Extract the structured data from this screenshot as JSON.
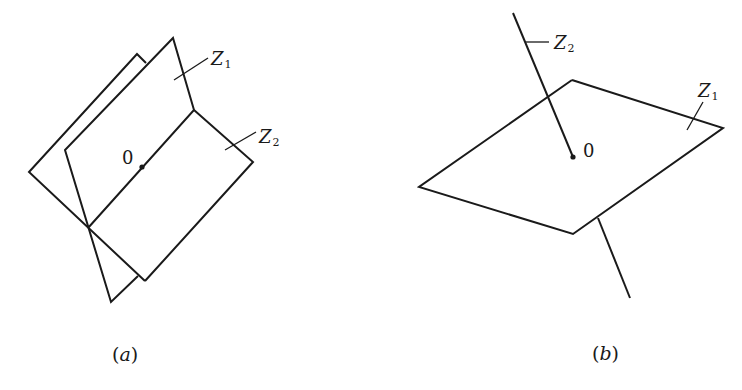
{
  "figure": {
    "stroke_color": "#1a1a1a",
    "background": "#ffffff",
    "panels": [
      {
        "id": "a",
        "caption": {
          "open": "(",
          "letter": "a",
          "close": ")",
          "x": 112,
          "y": 361
        },
        "description": "Two planes Z1 and Z2 intersecting along a line through the origin 0",
        "polylines": [
          {
            "name": "back-plane-z1-outline",
            "points": "146,63 137,54 29,172 145,281"
          },
          {
            "name": "back-plane-z1-bottom",
            "points": "138,276 111,302 65,150 173,38 194,110 88,228"
          },
          {
            "name": "plane-z2-outline",
            "points": "194,110 253,162 145,281"
          }
        ],
        "origin_dot": {
          "cx": 142,
          "cy": 167,
          "r": 2.6
        },
        "origin_label": {
          "text": "0",
          "x": 122,
          "y": 164
        },
        "labels": [
          {
            "name": "z1-label",
            "main": "Z",
            "sub": "1",
            "x": 211,
            "y": 65,
            "leader": {
              "x1": 174,
              "y1": 80,
              "x2": 208,
              "y2": 58
            }
          },
          {
            "name": "z2-label",
            "main": "Z",
            "sub": "2",
            "x": 259,
            "y": 143,
            "leader": {
              "x1": 225,
              "y1": 150,
              "x2": 256,
              "y2": 132
            }
          }
        ]
      },
      {
        "id": "b",
        "caption": {
          "open": "(",
          "letter": "b",
          "close": ")",
          "x": 592,
          "y": 360
        },
        "description": "Plane Z1 pierced by line Z2 at the origin 0",
        "polylines": [
          {
            "name": "plane-z1-outline",
            "points": "572,80 723,128 573,234 419,187 572,80"
          },
          {
            "name": "line-z2-upper",
            "points": "513,13 573,157"
          },
          {
            "name": "line-z2-lower",
            "points": "598,218 630,298"
          }
        ],
        "origin_dot": {
          "cx": 573,
          "cy": 157,
          "r": 2.6
        },
        "origin_label": {
          "text": "0",
          "x": 583,
          "y": 157
        },
        "labels": [
          {
            "name": "z2-label",
            "main": "Z",
            "sub": "2",
            "x": 554,
            "y": 49,
            "leader": {
              "x1": 526,
              "y1": 42,
              "x2": 549,
              "y2": 42
            }
          },
          {
            "name": "z1-label",
            "main": "Z",
            "sub": "1",
            "x": 698,
            "y": 97,
            "leader": {
              "x1": 687,
              "y1": 130,
              "x2": 703,
              "y2": 102
            }
          }
        ]
      }
    ]
  }
}
